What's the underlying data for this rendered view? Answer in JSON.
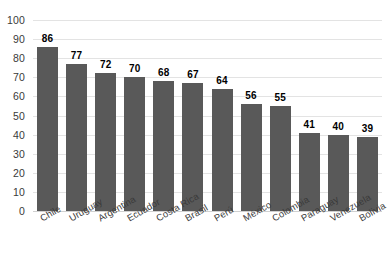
{
  "chart_data": {
    "type": "bar",
    "title": "",
    "subtitle": "",
    "xlabel": "",
    "ylabel": "",
    "ylim": [
      0,
      100
    ],
    "ytick_step": 10,
    "yticks": [
      100,
      90,
      80,
      70,
      60,
      50,
      40,
      30,
      20,
      10,
      0
    ],
    "grid": true,
    "legend": false,
    "legend_position": "none",
    "categories": [
      "Chile",
      "Uruguay",
      "Argentina",
      "Ecuador",
      "Costa Rica",
      "Brasil",
      "Perú",
      "México",
      "Colombia",
      "Paraguay",
      "Venezuela",
      "Bolivia"
    ],
    "values": [
      86,
      77,
      72,
      70,
      68,
      67,
      64,
      56,
      55,
      41,
      40,
      39
    ],
    "data_labels": [
      "86",
      "77",
      "72",
      "70",
      "68",
      "67",
      "64",
      "56",
      "55",
      "41",
      "40",
      "39"
    ],
    "bar_color": "#595959",
    "gridline_color": "#e3e3e3",
    "label_color": "#3a3a3a",
    "value_label_color": "#000000",
    "background_color": "#ffffff"
  }
}
